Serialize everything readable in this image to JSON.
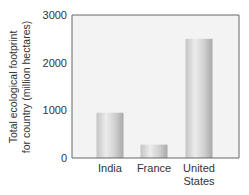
{
  "chart_data": {
    "type": "bar",
    "title": "",
    "xlabel": "",
    "ylabel": [
      "Total ecological footprint",
      "for country (million hectares)"
    ],
    "categories": [
      [
        "India"
      ],
      [
        "France"
      ],
      [
        "United",
        "States"
      ]
    ],
    "values": [
      950,
      280,
      2500
    ],
    "ylim": [
      0,
      3000
    ],
    "yticks": [
      0,
      1000,
      2000,
      3000
    ],
    "ytick_labels": [
      "0",
      "1000",
      "2000",
      "3000"
    ],
    "grid": false,
    "legend": null,
    "colors": {
      "plot_bg": "#f3f3f3",
      "frame": "#666666",
      "bar_light": "#eeeeee",
      "bar_dark": "#aaaaaa"
    }
  }
}
